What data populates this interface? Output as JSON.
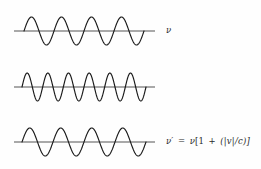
{
  "figure": {
    "background_color": "#fefefe",
    "stroke_color": "#1a1a1a",
    "baseline_color": "#555555",
    "text_color": "#2a2a2a",
    "width": 261,
    "height": 169
  },
  "rows": [
    {
      "id": "source-wave",
      "cycles": 4,
      "baseline_y": 31,
      "amplitude": 14,
      "wave_start_x": 14,
      "wave_end_x": 155,
      "osc_start_x": 24,
      "osc_end_x": 144,
      "label_plain": "ν",
      "label_parts": {
        "lhs": "ν",
        "equals": "",
        "rhs": ""
      }
    },
    {
      "id": "approaching-wave-blueshift",
      "cycles": 6,
      "baseline_y": 87,
      "amplitude": 14,
      "wave_start_x": 14,
      "wave_end_x": 155,
      "osc_start_x": 22,
      "osc_end_x": 146,
      "label_plain": "ν′ = ν[1 + (|v|/c)]",
      "label_parts": {
        "lhs": "ν′",
        "equals": "=",
        "rhs": "ν[1 + (|v|/c)]",
        "nu": "ν",
        "bracket_open": "[1",
        "operator": "+",
        "ratio": "(|v|/c)]"
      }
    },
    {
      "id": "receding-wave-redshift",
      "cycles": 4,
      "baseline_y": 142,
      "amplitude": 14,
      "wave_start_x": 14,
      "wave_end_x": 155,
      "osc_start_x": 22,
      "osc_end_x": 146,
      "label_plain": "ν′ = ν[1 − (|v|/c)]",
      "label_parts": {
        "lhs": "ν′",
        "equals": "=",
        "rhs": "ν[1 − (|v|/c)]",
        "nu": "ν",
        "bracket_open": "[1",
        "operator": "−",
        "ratio": "(|v|/c)]"
      }
    }
  ]
}
